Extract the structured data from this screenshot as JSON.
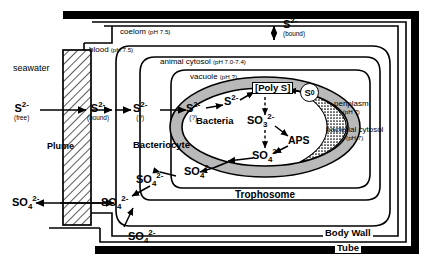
{
  "diagram": {
    "colors": {
      "line": "#000000",
      "shade": "#b8b8b8",
      "background": "#ffffff"
    },
    "compartments": {
      "seawater": "seawater",
      "plume": "Plume",
      "blood": "blood",
      "blood_ph": "(pH 7.5)",
      "coelom": "coelom",
      "coelom_ph": "(pH 7.5)",
      "animal_cytosol": "animal cytosol",
      "animal_cytosol_ph": "(pH 7.0-7.4)",
      "vacuole": "vacuole",
      "vacuole_ph": "(pH ?)",
      "bacteria": "Bacteria",
      "bacteriocyte": "Bacteriocyte",
      "periplasm": "periplasm",
      "periplasm_ph": "(pH ?)",
      "bacterial_cytosol": "bacterial cytosol",
      "bacterial_cytosol_ph": "(pH 7)",
      "trophosome": "Trophosome",
      "body_wall": "Body Wall",
      "tube": "Tube"
    },
    "species": {
      "sulfide": "S",
      "sulfide_charge": "2-",
      "free": "(free)",
      "bound": "(bound)",
      "unknown": "(?)",
      "sulfate": "SO",
      "sulfate_sub": "4",
      "sulfate_charge": "2-",
      "sulfite": "SO",
      "sulfite_sub": "3",
      "sulfite_charge": "2-",
      "poly_s": "[Poly S]",
      "elemental_s": "S",
      "elemental_s_charge": "0",
      "aps": "APS"
    },
    "arrows": [
      {
        "name": "seawater-to-plume",
        "label": "S2- free to S2- bound"
      },
      {
        "name": "plume-to-blood",
        "label": "S2- bound transport"
      },
      {
        "name": "blood-to-cytosol",
        "label": "S2- (?) into animal cytosol"
      },
      {
        "name": "cytosol-to-vacuole",
        "label": "S2- (?) into vacuole"
      },
      {
        "name": "vacuole-to-bacteria",
        "label": "S2- into bacteria"
      },
      {
        "name": "bacteria-to-polys",
        "label": "S2- to [Poly S]"
      },
      {
        "name": "s0-to-polys",
        "label": "S0 to [Poly S]"
      },
      {
        "name": "polys-to-sulfite",
        "label": "[Poly S] to SO3 2-"
      },
      {
        "name": "sulfite-to-aps",
        "label": "SO3 2- to APS"
      },
      {
        "name": "aps-to-sulfate",
        "label": "APS to SO4 2-"
      },
      {
        "name": "sulfite-to-sulfate",
        "label": "SO3 2- to SO4 2-"
      },
      {
        "name": "sulfate-efflux",
        "label": "SO4 2- out of bacteria"
      },
      {
        "name": "sulfate-to-blood",
        "label": "SO4 2- to blood"
      },
      {
        "name": "sulfate-to-seawater",
        "label": "SO4 2- released to seawater"
      },
      {
        "name": "sulfate-from-bodywall",
        "label": "SO4 2- from body wall"
      },
      {
        "name": "coelom-exchange",
        "label": "S2- (bound) exchange coelom"
      }
    ]
  }
}
